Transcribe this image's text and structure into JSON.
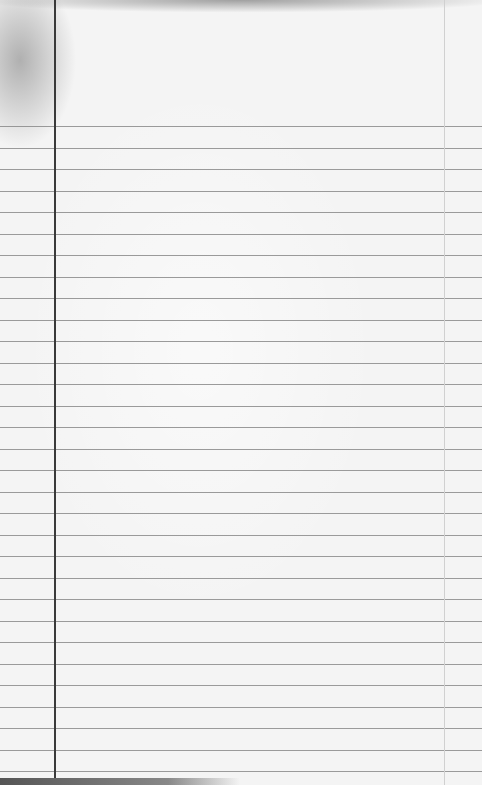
{
  "image": {
    "subject": "blank lined notebook paper",
    "ruled_lines": {
      "count": 31,
      "first_y": 126,
      "spacing_px": 21.5,
      "color": "#8a8a8a"
    },
    "margin_line": {
      "x": 54,
      "color": "#3a3a3a"
    },
    "paper_color": "#f4f4f4",
    "text": ""
  }
}
